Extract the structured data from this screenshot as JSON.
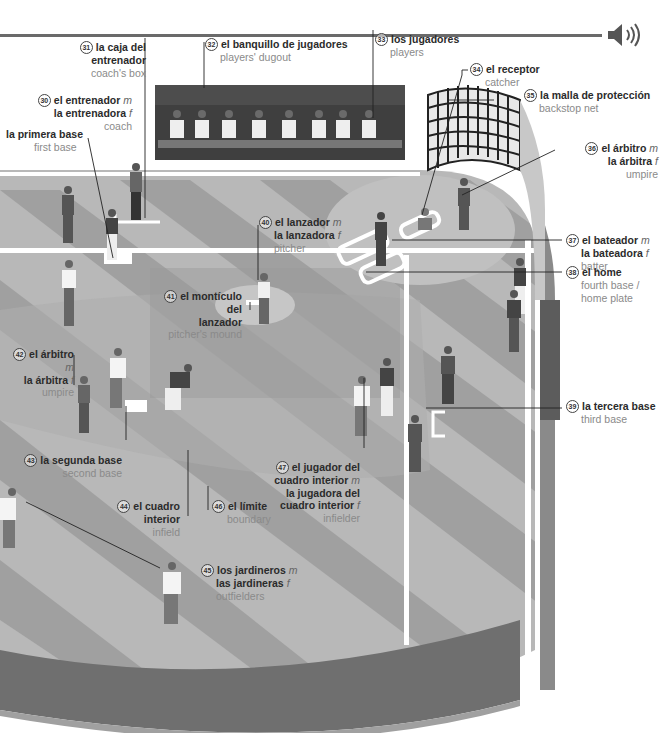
{
  "header": {
    "audio_icon": "speaker-icon"
  },
  "colors": {
    "field_light": "#b5b5b5",
    "field_stripe": "#9d9d9d",
    "infield": "#a9a9a9",
    "mound": "#c4c4c4",
    "wall": "#6e6e6e",
    "dugout": "#3f3f3f",
    "chalk": "#ffffff"
  },
  "labels": [
    {
      "id": "31",
      "es": "la caja del entrenador",
      "en": "coach's box"
    },
    {
      "id": "32",
      "es": "el banquillo de jugadores",
      "en": "players' dugout"
    },
    {
      "id": "33",
      "es": "los jugadores",
      "en": "players"
    },
    {
      "id": "34",
      "es": "el receptor",
      "en": "catcher"
    },
    {
      "id": "35",
      "es": "la malla de protección",
      "en": "backstop net"
    },
    {
      "id": "30",
      "es_m": "el entrenador",
      "es_f": "la entrenadora",
      "en": "coach"
    },
    {
      "id": "",
      "es": "la primera base",
      "en": "first base"
    },
    {
      "id": "36",
      "es_m": "el árbitro",
      "es_f": "la árbitra",
      "en": "umpire"
    },
    {
      "id": "40",
      "es_m": "el lanzador",
      "es_f": "la lanzadora",
      "en": "pitcher"
    },
    {
      "id": "37",
      "es_m": "el bateador",
      "es_f": "la bateadora",
      "en": "batter"
    },
    {
      "id": "38",
      "es": "el home",
      "en1": "fourth base /",
      "en2": "home plate"
    },
    {
      "id": "41",
      "es1": "el montículo del",
      "es2": "lanzador",
      "en": "pitcher's mound"
    },
    {
      "id": "42",
      "es_m": "el árbitro",
      "es_f": "la árbitra",
      "en": "umpire"
    },
    {
      "id": "39",
      "es": "la tercera base",
      "en": "third base"
    },
    {
      "id": "43",
      "es": "la segunda base",
      "en": "second base"
    },
    {
      "id": "47",
      "es1": "el jugador del",
      "es2": "cuadro interior",
      "es3": "la jugadora del",
      "es4": "cuadro interior",
      "en": "infielder"
    },
    {
      "id": "44",
      "es": "el cuadro interior",
      "en": "infield"
    },
    {
      "id": "46",
      "es": "el límite",
      "en": "boundary"
    },
    {
      "id": "45",
      "es_m": "los jardineros",
      "es_f": "las jardineras",
      "en": "outfielders"
    }
  ],
  "gender": {
    "m": "m",
    "f": "f"
  }
}
